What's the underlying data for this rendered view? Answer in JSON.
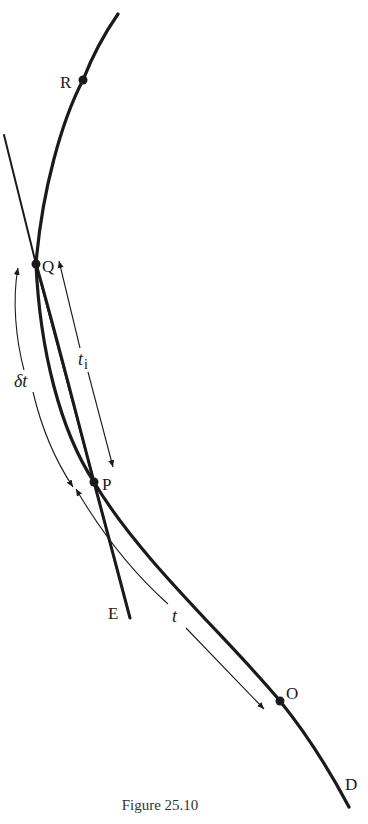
{
  "figure": {
    "caption": "Figure 25.10",
    "points": {
      "R": "R",
      "Q": "Q",
      "P": "P",
      "O": "O",
      "D": "D",
      "E": "E"
    },
    "intervals": {
      "t": "t",
      "t_i_base": "t",
      "t_i_sub": "i",
      "delta_t": "δt"
    },
    "colors": {
      "ink": "#1a1a1a",
      "background": "#ffffff"
    }
  }
}
